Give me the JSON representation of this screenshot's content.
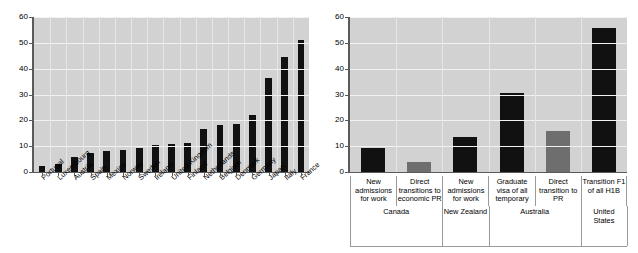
{
  "chart_data": [
    {
      "id": "left",
      "type": "bar",
      "title": "",
      "xlabel": "",
      "ylabel": "",
      "ylim": [
        0,
        60
      ],
      "yticks": [
        0,
        10,
        20,
        30,
        40,
        50,
        60
      ],
      "grid": true,
      "legend": "none",
      "bar_color": "#111111",
      "plot_background": "#d2d2d2",
      "categories": [
        "Portugal",
        "Luxembourg",
        "Austria",
        "Spain",
        "Mexico",
        "Norway",
        "Sweden",
        "Ireland",
        "United Kingdom",
        "Finland",
        "Netherlands",
        "Belgium",
        "Denmark",
        "Germany",
        "Japan",
        "Italy",
        "France"
      ],
      "values": [
        2.3,
        3.0,
        5.7,
        7.2,
        8.3,
        8.6,
        9.4,
        10.4,
        11.0,
        11.4,
        16.6,
        18.1,
        18.6,
        22.0,
        36.2,
        44.6,
        51.0
      ]
    },
    {
      "id": "right",
      "type": "bar",
      "title": "",
      "xlabel": "",
      "ylabel": "",
      "ylim": [
        0,
        60
      ],
      "yticks": [
        0,
        10,
        20,
        30,
        40,
        50,
        60
      ],
      "grid": true,
      "legend": "none",
      "bar_color": "#111111",
      "bar_color_alt": "#6e6e6e",
      "plot_background": "#d2d2d2",
      "categories": [
        "New admissions for work",
        "Direct transitions to economic PR",
        "New admissions for work",
        "Graduate visa of all temporary",
        "Direct transition to PR",
        "Transition F1 of all H1B"
      ],
      "category_lines": [
        [
          "New",
          "admissions",
          "for work"
        ],
        [
          "Direct",
          "transitions to",
          "economic PR"
        ],
        [
          "New",
          "admissions",
          "for work"
        ],
        [
          "Graduate",
          "visa of all",
          "temporary"
        ],
        [
          "Direct",
          "transition to",
          "PR"
        ],
        [
          "Transition F1",
          "of all H1B"
        ]
      ],
      "values": [
        9.2,
        3.7,
        13.4,
        30.7,
        15.8,
        55.7
      ],
      "bar_colors": [
        "#111111",
        "#6e6e6e",
        "#111111",
        "#111111",
        "#6e6e6e",
        "#111111"
      ],
      "groups": [
        {
          "label": "Canada",
          "label_lines": [
            "Canada"
          ],
          "span": 2
        },
        {
          "label": "New Zealand",
          "label_lines": [
            "New Zealand"
          ],
          "span": 1
        },
        {
          "label": "Australia",
          "label_lines": [
            "Australia"
          ],
          "span": 2
        },
        {
          "label": "United States",
          "label_lines": [
            "United",
            "States"
          ],
          "span": 1
        }
      ]
    }
  ]
}
